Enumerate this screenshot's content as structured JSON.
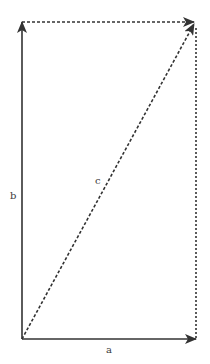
{
  "diagram": {
    "colors": {
      "solid": "#333333",
      "dashed": "#333333",
      "background": "#ffffff"
    },
    "vectors": [
      {
        "id": "a",
        "label": "a",
        "style": "solid",
        "from": "origin",
        "to": "a_end"
      },
      {
        "id": "b",
        "label": "b",
        "style": "solid",
        "from": "origin",
        "to": "b_end"
      },
      {
        "id": "c",
        "label": "c",
        "style": "dashed",
        "from": "origin",
        "to": "sum_end"
      }
    ],
    "helper_lines": [
      {
        "id": "top-dashed",
        "style": "dashed",
        "from": "b_end",
        "to": "sum_end"
      },
      {
        "id": "right-dashed",
        "style": "dashed",
        "from": "a_end",
        "to": "sum_end"
      }
    ],
    "labels": {
      "a": "a",
      "b": "b",
      "c": "c"
    }
  }
}
